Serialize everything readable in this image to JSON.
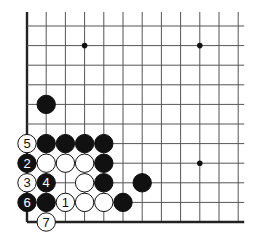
{
  "board": {
    "origin_x": 27,
    "origin_y": 26,
    "step_x": 19.2,
    "step_y": 19.6,
    "cols": 12,
    "rows": 11,
    "left_edge": true,
    "bottom_edge": true,
    "line_color": "#555555",
    "edge_color": "#222222"
  },
  "star_points": [
    [
      3,
      1
    ],
    [
      9,
      1
    ],
    [
      9,
      7
    ]
  ],
  "stones": [
    {
      "c": 1,
      "r": 4,
      "color": "black",
      "label": ""
    },
    {
      "c": 0,
      "r": 6,
      "color": "white",
      "label": "5"
    },
    {
      "c": 1,
      "r": 6,
      "color": "black",
      "label": ""
    },
    {
      "c": 2,
      "r": 6,
      "color": "black",
      "label": ""
    },
    {
      "c": 3,
      "r": 6,
      "color": "black",
      "label": ""
    },
    {
      "c": 4,
      "r": 6,
      "color": "black",
      "label": ""
    },
    {
      "c": 0,
      "r": 7,
      "color": "black",
      "label": "2"
    },
    {
      "c": 1,
      "r": 7,
      "color": "white",
      "label": ""
    },
    {
      "c": 2,
      "r": 7,
      "color": "white",
      "label": ""
    },
    {
      "c": 3,
      "r": 7,
      "color": "white",
      "label": ""
    },
    {
      "c": 4,
      "r": 7,
      "color": "black",
      "label": ""
    },
    {
      "c": 0,
      "r": 8,
      "color": "white",
      "label": "3"
    },
    {
      "c": 1,
      "r": 8,
      "color": "black",
      "label": "4"
    },
    {
      "c": 3,
      "r": 8,
      "color": "white",
      "label": ""
    },
    {
      "c": 4,
      "r": 8,
      "color": "black",
      "label": ""
    },
    {
      "c": 6,
      "r": 8,
      "color": "black",
      "label": ""
    },
    {
      "c": 0,
      "r": 9,
      "color": "black",
      "label": "6"
    },
    {
      "c": 1,
      "r": 9,
      "color": "black",
      "label": ""
    },
    {
      "c": 2,
      "r": 9,
      "color": "white",
      "label": "1"
    },
    {
      "c": 3,
      "r": 9,
      "color": "white",
      "label": ""
    },
    {
      "c": 4,
      "r": 9,
      "color": "white",
      "label": ""
    },
    {
      "c": 5,
      "r": 9,
      "color": "black",
      "label": ""
    },
    {
      "c": 1,
      "r": 10,
      "color": "white",
      "label": "7"
    }
  ]
}
